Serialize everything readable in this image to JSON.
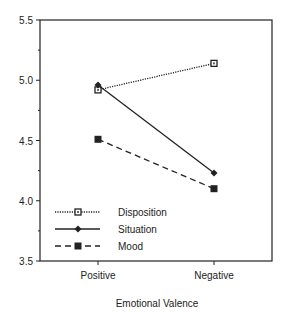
{
  "chart_data": {
    "type": "line",
    "title": "",
    "xlabel": "Emotional Valence",
    "ylabel": "",
    "categories": [
      "Positive",
      "Negative"
    ],
    "ylim": [
      3.5,
      5.5
    ],
    "yticks": [
      "3.5",
      "4.0",
      "4.5",
      "5.0",
      "5.5"
    ],
    "grid": false,
    "legend_position": "lower-left inside",
    "series": [
      {
        "name": "Disposition",
        "values": [
          4.92,
          5.14
        ],
        "line": "dotted",
        "marker": "open-square"
      },
      {
        "name": "Situation",
        "values": [
          4.96,
          4.23
        ],
        "line": "solid",
        "marker": "diamond"
      },
      {
        "name": "Mood",
        "values": [
          4.51,
          4.1
        ],
        "line": "dashed",
        "marker": "filled-square"
      }
    ]
  }
}
